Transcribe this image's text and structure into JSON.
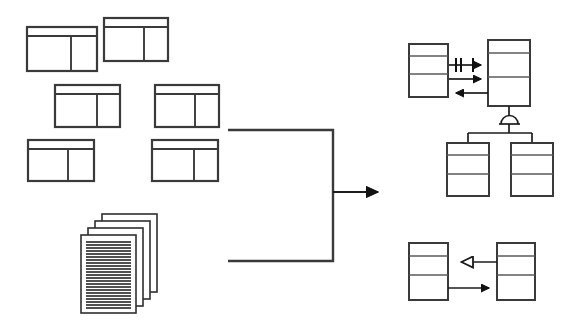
{
  "diagram": {
    "title": "Relational schema and documents transformed into UML class model",
    "background_color": "#ffffff",
    "line_color": "#2b2b2b",
    "accent_color": "#111111",
    "width": 585,
    "height": 333
  },
  "source_side": {
    "label": "source-artifacts",
    "tables": [
      {
        "name": "table-icon-1",
        "x": 27,
        "y": 27,
        "w": 70,
        "h": 44,
        "header_h": 9,
        "split_ratio": 0.63
      },
      {
        "name": "table-icon-2",
        "x": 104,
        "y": 18,
        "w": 64,
        "h": 43,
        "header_h": 9,
        "split_ratio": 0.63
      },
      {
        "name": "table-icon-3",
        "x": 55,
        "y": 85,
        "w": 65,
        "h": 42,
        "header_h": 9,
        "split_ratio": 0.65
      },
      {
        "name": "table-icon-4",
        "x": 155,
        "y": 85,
        "w": 64,
        "h": 42,
        "header_h": 9,
        "split_ratio": 0.63
      },
      {
        "name": "table-icon-5",
        "x": 28,
        "y": 140,
        "w": 66,
        "h": 41,
        "header_h": 9,
        "split_ratio": 0.6
      },
      {
        "name": "table-icon-6",
        "x": 152,
        "y": 140,
        "w": 66,
        "h": 41,
        "header_h": 9,
        "split_ratio": 0.63
      }
    ],
    "document_stack": {
      "name": "document-stack",
      "sheets": 4,
      "front_x": 81,
      "front_y": 235,
      "sheet_w": 55,
      "sheet_h": 78,
      "offset_x": 7,
      "offset_y": 7,
      "text_lines": 22
    }
  },
  "connector": {
    "name": "transformation-connector",
    "bracket": {
      "left": 228,
      "right": 333,
      "top": 130,
      "bottom": 261
    },
    "arrow": {
      "from_x": 333,
      "to_x": 387,
      "y": 192
    }
  },
  "target_side": {
    "label": "uml-class-model",
    "classes": [
      {
        "name": "class-box-a",
        "x": 409,
        "y": 44,
        "w": 39,
        "h": 53,
        "div1": 0.22,
        "div2": 0.55
      },
      {
        "name": "class-box-b",
        "x": 488,
        "y": 40,
        "w": 42,
        "h": 66,
        "div1": 0.2,
        "div2": 0.55
      },
      {
        "name": "class-box-c",
        "x": 447,
        "y": 143,
        "w": 42,
        "h": 53,
        "div1": 0.22,
        "div2": 0.58
      },
      {
        "name": "class-box-d",
        "x": 511,
        "y": 143,
        "w": 42,
        "h": 53,
        "div1": 0.22,
        "div2": 0.58
      },
      {
        "name": "class-box-e",
        "x": 409,
        "y": 243,
        "w": 39,
        "h": 57,
        "div1": 0.22,
        "div2": 0.55
      },
      {
        "name": "class-box-f",
        "x": 497,
        "y": 243,
        "w": 38,
        "h": 57,
        "div1": 0.22,
        "div2": 0.55
      }
    ],
    "relationships": [
      {
        "name": "association-multiplicity",
        "kind": "association-with-cardinality",
        "from": "class-box-a",
        "to": "class-box-b",
        "y": 65,
        "x1": 449,
        "x2": 488,
        "direction": "right",
        "ticks": 3
      },
      {
        "name": "association-forward",
        "kind": "directed-association",
        "from": "class-box-a",
        "to": "class-box-b",
        "y": 79,
        "x1": 449,
        "x2": 488,
        "direction": "right"
      },
      {
        "name": "association-back",
        "kind": "directed-association",
        "from": "class-box-b",
        "to": "class-box-a",
        "y": 93,
        "x1": 449,
        "x2": 488,
        "direction": "left"
      },
      {
        "name": "generalization-arc",
        "kind": "subtype-arc",
        "parent": "class-box-b",
        "children": [
          "class-box-c",
          "class-box-d"
        ],
        "arc_cx": 509,
        "arc_cy": 123,
        "arc_r": 8
      },
      {
        "name": "generalization-hollow",
        "kind": "generalization",
        "from": "class-box-f",
        "to": "class-box-e",
        "y": 262,
        "x1": 448,
        "x2": 497,
        "direction": "left"
      },
      {
        "name": "association-filled",
        "kind": "directed-association",
        "from": "class-box-e",
        "to": "class-box-f",
        "y": 288,
        "x1": 448,
        "x2": 497,
        "direction": "right"
      }
    ]
  }
}
